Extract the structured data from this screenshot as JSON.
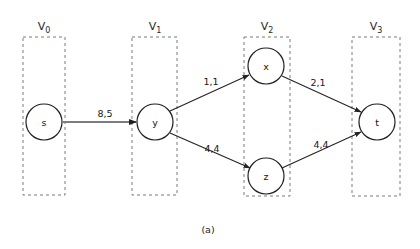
{
  "figure": {
    "caption": "(a)",
    "caption_x": 208,
    "caption_y": 229
  },
  "colors": {
    "background": "#ffffff",
    "node_stroke": "#1f1f1f",
    "node_fill": "#ffffff",
    "edge_stroke": "#232323",
    "highlight_edge_stroke": "#7d7d7d",
    "layer_box_stroke": "#7a7a7a",
    "text": "#1a1a1a"
  },
  "chart_data": {
    "type": "diagram",
    "diagram_kind": "layered-flow-network",
    "title": "(a)",
    "layers": [
      {
        "id": "V0",
        "label": "V",
        "subscript": "0",
        "label_x": 44,
        "label_y": 30,
        "box": {
          "x": 23,
          "y": 37,
          "width": 42,
          "height": 158
        },
        "nodes": [
          "s"
        ]
      },
      {
        "id": "V1",
        "label": "V",
        "subscript": "1",
        "label_x": 155,
        "label_y": 30,
        "box": {
          "x": 132,
          "y": 37,
          "width": 45,
          "height": 158
        },
        "nodes": [
          "y"
        ]
      },
      {
        "id": "V2",
        "label": "V",
        "subscript": "2",
        "label_x": 267,
        "label_y": 30,
        "box": {
          "x": 244,
          "y": 37,
          "width": 46,
          "height": 159
        },
        "nodes": [
          "x",
          "z"
        ]
      },
      {
        "id": "V3",
        "label": "V",
        "subscript": "3",
        "label_x": 376,
        "label_y": 30,
        "box": {
          "x": 352,
          "y": 37,
          "width": 48,
          "height": 159
        },
        "nodes": [
          "t"
        ]
      }
    ],
    "nodes": [
      {
        "id": "s",
        "label": "s",
        "cx": 44,
        "cy": 122,
        "r": 18,
        "layer": "V0"
      },
      {
        "id": "y",
        "label": "y",
        "cx": 155,
        "cy": 122,
        "r": 18,
        "layer": "V1"
      },
      {
        "id": "x",
        "label": "x",
        "cx": 266,
        "cy": 66,
        "r": 18,
        "layer": "V2"
      },
      {
        "id": "z",
        "label": "z",
        "cx": 266,
        "cy": 176,
        "r": 18,
        "layer": "V2"
      },
      {
        "id": "t",
        "label": "t",
        "cx": 377,
        "cy": 122,
        "r": 18,
        "layer": "V3"
      }
    ],
    "edges": [
      {
        "id": "s-y",
        "from": "s",
        "to": "y",
        "label": "8,5",
        "capacity": 8,
        "flow": 5,
        "label_x": 105,
        "label_y": 113,
        "x1": 63,
        "y1": 122,
        "x2": 136,
        "y2": 122,
        "style": "thick-gray"
      },
      {
        "id": "y-x",
        "from": "y",
        "to": "x",
        "label": "1,1",
        "capacity": 1,
        "flow": 1,
        "label_x": 211,
        "label_y": 81,
        "x1": 170,
        "y1": 111,
        "x2": 249,
        "y2": 75,
        "style": "thin-dark"
      },
      {
        "id": "y-z",
        "from": "y",
        "to": "z",
        "label": "4,4",
        "capacity": 4,
        "flow": 4,
        "label_x": 212,
        "label_y": 148,
        "x1": 170,
        "y1": 133,
        "x2": 250,
        "y2": 168,
        "style": "thin-dark"
      },
      {
        "id": "x-t",
        "from": "x",
        "to": "t",
        "label": "2,1",
        "capacity": 2,
        "flow": 1,
        "label_x": 318,
        "label_y": 82,
        "x1": 282,
        "y1": 76,
        "x2": 361,
        "y2": 112,
        "style": "thin-dark"
      },
      {
        "id": "z-t",
        "from": "z",
        "to": "t",
        "label": "4,4",
        "capacity": 4,
        "flow": 4,
        "label_x": 321,
        "label_y": 144,
        "x1": 282,
        "y1": 168,
        "x2": 361,
        "y2": 132,
        "style": "thin-dark"
      }
    ],
    "xlabel": "",
    "ylabel": "",
    "legend": [],
    "grid": false
  }
}
